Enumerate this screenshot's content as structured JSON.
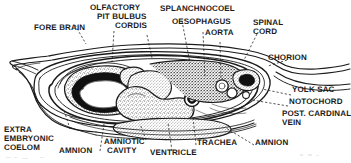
{
  "figure": {
    "background_color": "#ffffff",
    "ink_color": "#1a1a1a",
    "stipple_color": "#4a4a4a",
    "width": 351,
    "height": 163
  },
  "labels": {
    "fore_brain": "FORE BRAIN",
    "olfactory": "OLFACTORY",
    "pit_bulbus": "PIT BULBUS",
    "cordis": "CORDIS",
    "splanchnocoel": "SPLANCHNOCOEL",
    "oesophagus": "OESOPHAGUS",
    "aorta": "AORTA",
    "spinal": "SPINAL",
    "cord": "CORD",
    "chorion": "CHORION",
    "yolk_sac": "YOLK SAC",
    "notochord": "NOTOCHORD",
    "post_cardinal": "POST. CARDINAL",
    "vein": "VEIN",
    "amnion_right": "AMNION",
    "trachea": "TRACHEA",
    "ventricle": "VENTRICLE",
    "amniotic": "AMNIOTIC",
    "cavity": "CAVITY",
    "amnion_left": "AMNION",
    "extra": "EXTRA",
    "embryonic": "EMBRYONIC",
    "coelom": "COELOM"
  },
  "structures": [
    {
      "name": "fore-brain",
      "region": "left",
      "description": "large lobed neural vesicle with dark wall and white lumen"
    },
    {
      "name": "olfactory-pit",
      "region": "upper-left-centre",
      "description": "small stippled invagination"
    },
    {
      "name": "bulbus-cordis",
      "region": "centre-left",
      "description": "stippled rounded cardiac outflow mass"
    },
    {
      "name": "ventricle",
      "region": "centre",
      "description": "large irregular stippled cardiac chamber"
    },
    {
      "name": "splanchnocoel",
      "region": "centre-top",
      "description": "body cavity space"
    },
    {
      "name": "oesophagus",
      "region": "centre-right",
      "description": "small rounded tube"
    },
    {
      "name": "trachea",
      "region": "centre-right",
      "description": "small ringed tube"
    },
    {
      "name": "aorta",
      "region": "right-centre",
      "description": "circular vessel lumen"
    },
    {
      "name": "post-cardinal-vein",
      "region": "right",
      "description": "circular vessel lumen"
    },
    {
      "name": "notochord",
      "region": "right",
      "description": "small rod beneath spinal cord"
    },
    {
      "name": "spinal-cord",
      "region": "right-top",
      "description": "dark neural tube in tail region"
    },
    {
      "name": "amnion",
      "region": "enclosing",
      "description": "inner membrane bounding amniotic cavity"
    },
    {
      "name": "amniotic-cavity",
      "region": "around-embryo",
      "description": "space between embryo and amnion"
    },
    {
      "name": "chorion",
      "region": "outer",
      "description": "outermost membrane extending right"
    },
    {
      "name": "yolk-sac",
      "region": "right-outer",
      "description": "membrane extending to the right"
    },
    {
      "name": "extra-embryonic-coelom",
      "region": "left-outer",
      "description": "space between amnion and chorion"
    }
  ]
}
